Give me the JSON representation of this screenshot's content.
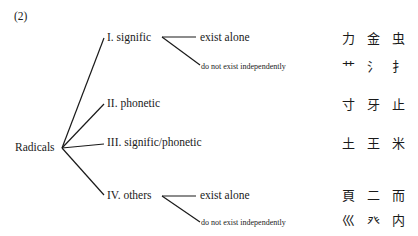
{
  "figure_label": "(2)",
  "root": "Radicals",
  "branches": [
    {
      "label": "I.  signific",
      "sub": [
        {
          "label": "exist alone",
          "examples": "力 金 虫"
        },
        {
          "label": "do not exist independently",
          "examples": "艹 氵 扌"
        }
      ]
    },
    {
      "label": "II.  phonetic",
      "examples": "寸 牙 止"
    },
    {
      "label": "III.  signific/phonetic",
      "examples": "土 王 米"
    },
    {
      "label": "IV.  others",
      "sub": [
        {
          "label": "exist alone",
          "examples": "頁 二 而"
        },
        {
          "label": "do not exist independently",
          "examples": "巛 癶 内"
        }
      ]
    }
  ]
}
